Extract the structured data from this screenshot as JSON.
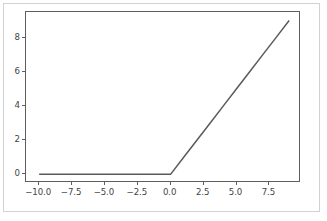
{
  "chart_data": {
    "type": "line",
    "title": "",
    "xlabel": "",
    "ylabel": "",
    "xlim": [
      -11.0,
      9.9
    ],
    "ylim": [
      -0.52,
      9.5
    ],
    "xticks": [
      -10.0,
      -7.5,
      -5.0,
      -2.5,
      0.0,
      2.5,
      5.0,
      7.5
    ],
    "xtick_labels": [
      "−10.0",
      "−7.5",
      "−5.0",
      "−2.5",
      "0.0",
      "2.5",
      "5.0",
      "7.5"
    ],
    "yticks": [
      0,
      2,
      4,
      6,
      8
    ],
    "ytick_labels": [
      "0",
      "2",
      "4",
      "6",
      "8"
    ],
    "grid": false,
    "legend": null,
    "line_color": "#5a5a5a",
    "line_width": 1.5,
    "series": [
      {
        "name": "ReLU",
        "x": [
          -10.0,
          -9.0,
          -8.0,
          -7.0,
          -6.0,
          -5.0,
          -4.0,
          -3.0,
          -2.0,
          -1.0,
          0.0,
          1.0,
          2.0,
          3.0,
          4.0,
          5.0,
          6.0,
          7.0,
          8.0,
          9.0
        ],
        "y": [
          0.0,
          0.0,
          0.0,
          0.0,
          0.0,
          0.0,
          0.0,
          0.0,
          0.0,
          0.0,
          0.0,
          1.0,
          2.0,
          3.0,
          4.0,
          5.0,
          6.0,
          7.0,
          8.0,
          9.0
        ]
      }
    ]
  },
  "figure": {
    "background_color": "#ffffff",
    "frame_color": "#d2d2d2",
    "axes_edge_color": "#5e5e5e",
    "tick_color": "#3f3f3f"
  }
}
